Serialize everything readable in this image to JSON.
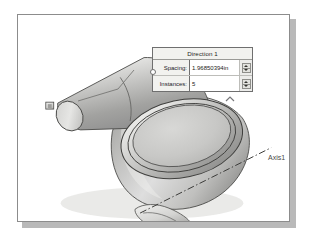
{
  "app": {
    "type": "cad-viewport",
    "background": "#ffffff",
    "viewport_border": "#8c8c8c"
  },
  "dialog": {
    "title": "Direction 1",
    "anchor_icon": "anchor-dot-icon",
    "fields": [
      {
        "label": "Spacing:",
        "value": "1.96850394in",
        "spinner_up": "spinner-up-icon",
        "spinner_down": "spinner-down-icon"
      },
      {
        "label": "Instances:",
        "value": "5",
        "spinner_up": "spinner-up-icon",
        "spinner_down": "spinner-down-icon"
      }
    ],
    "collapse_icon": "chevron-up-icon"
  },
  "model": {
    "axis_label": "Axis1",
    "axis_line_style": "dash-dot",
    "leader_line": "callout-leader",
    "parts": [
      {
        "name": "cylinder-body",
        "shading": "gray-gradient"
      },
      {
        "name": "dome-body",
        "shading": "gray-gradient"
      },
      {
        "name": "dome-top-face",
        "shading": "flat-gray"
      },
      {
        "name": "cylinder-end-tab",
        "shading": "light-gray"
      },
      {
        "name": "dome-bottom-tab",
        "shading": "light-gray"
      }
    ]
  },
  "colors": {
    "metal_light": "#e8e8e6",
    "metal_mid": "#b6b6b4",
    "metal_dark": "#8e8e8c",
    "outline": "#4a4a48",
    "dialog_bg": "#f2f2ef",
    "dialog_border": "#6f6f6f",
    "field_bg": "#ffffff",
    "shadow": "#b9b9b9"
  }
}
